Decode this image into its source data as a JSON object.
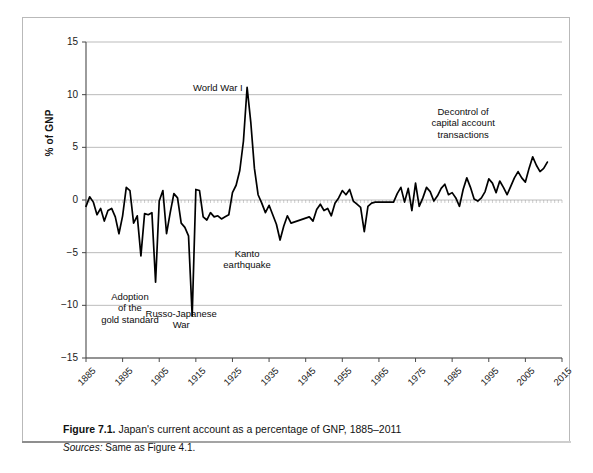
{
  "figure": {
    "caption_label": "Figure 7.1.",
    "caption_text": "Japan's current account as a percentage of GNP, 1885–2011",
    "sources_label": "Sources:",
    "sources_text": "Same as Figure 4.1."
  },
  "chart_data": {
    "type": "line",
    "title": "",
    "xlabel": "",
    "ylabel": "% of GNP",
    "xlim": [
      1885,
      2015
    ],
    "ylim": [
      -15,
      15
    ],
    "yticks": [
      15,
      10,
      5,
      0,
      -5,
      -10,
      -15
    ],
    "xticks": [
      1885,
      1895,
      1905,
      1915,
      1925,
      1935,
      1945,
      1955,
      1965,
      1975,
      1985,
      1995,
      2005,
      2015
    ],
    "grid": true,
    "legend": "none",
    "line_color": "#000000",
    "annotations": [
      {
        "name": "adoption-of-the-gold-standard",
        "lines": [
          "Adoption",
          "of the",
          "gold standard"
        ],
        "x": 1897,
        "y": -9.2
      },
      {
        "name": "russo-japanese-war",
        "lines": [
          "Russo-Japanese",
          "War"
        ],
        "x": 1911,
        "y": -10.8
      },
      {
        "name": "world-war-i",
        "lines": [
          "World War I"
        ],
        "x": 1921,
        "y": 10.6
      },
      {
        "name": "kanto-earthquake",
        "lines": [
          "Kanto",
          "earthquake"
        ],
        "x": 1929,
        "y": -5.1
      },
      {
        "name": "decontrol-of-capital-account-transactions",
        "lines": [
          "Decontrol of",
          "capital account",
          "transactions"
        ],
        "x": 1988,
        "y": 8.4
      }
    ],
    "x": [
      1885,
      1886,
      1887,
      1888,
      1889,
      1890,
      1891,
      1892,
      1893,
      1894,
      1895,
      1896,
      1897,
      1898,
      1899,
      1900,
      1901,
      1902,
      1903,
      1904,
      1905,
      1906,
      1907,
      1908,
      1909,
      1910,
      1911,
      1912,
      1913,
      1914,
      1915,
      1916,
      1917,
      1918,
      1919,
      1920,
      1921,
      1922,
      1923,
      1924,
      1925,
      1926,
      1927,
      1928,
      1929,
      1930,
      1931,
      1932,
      1933,
      1934,
      1935,
      1936,
      1937,
      1938,
      1939,
      1940,
      1941,
      1946,
      1947,
      1948,
      1949,
      1950,
      1951,
      1952,
      1953,
      1954,
      1955,
      1956,
      1957,
      1958,
      1959,
      1960,
      1961,
      1962,
      1963,
      1964,
      1965,
      1966,
      1967,
      1968,
      1969,
      1970,
      1971,
      1972,
      1973,
      1974,
      1975,
      1976,
      1977,
      1978,
      1979,
      1980,
      1981,
      1982,
      1983,
      1984,
      1985,
      1986,
      1987,
      1988,
      1989,
      1990,
      1991,
      1992,
      1993,
      1994,
      1995,
      1996,
      1997,
      1998,
      1999,
      2000,
      2001,
      2002,
      2003,
      2004,
      2005,
      2006,
      2007,
      2008,
      2009,
      2010,
      2011
    ],
    "y": [
      -0.6,
      0.3,
      -0.2,
      -1.4,
      -0.8,
      -2.0,
      -1.0,
      -0.8,
      -1.6,
      -3.2,
      -1.5,
      1.2,
      0.9,
      -2.2,
      -1.5,
      -5.3,
      -1.3,
      -1.4,
      -1.2,
      -7.8,
      -0.1,
      0.9,
      -3.2,
      -1.2,
      0.6,
      0.2,
      -2.2,
      -2.6,
      -3.4,
      -11.0,
      1.0,
      0.9,
      -1.6,
      -1.9,
      -1.2,
      -1.6,
      -1.5,
      -1.8,
      -1.6,
      -1.4,
      0.7,
      1.4,
      2.8,
      5.6,
      10.7,
      7.4,
      3.0,
      0.5,
      -0.3,
      -1.2,
      -0.5,
      -1.4,
      -2.3,
      -3.8,
      -2.5,
      -1.5,
      -2.2,
      -1.6,
      -2.0,
      -0.9,
      -0.4,
      -1.0,
      -0.8,
      -1.5,
      -0.3,
      0.2,
      0.9,
      0.5,
      1.0,
      -0.1,
      -0.4,
      -0.7,
      -3.0,
      -0.6,
      -0.3,
      -0.2,
      -0.2,
      -0.2,
      -0.2,
      -0.2,
      -0.2,
      0.6,
      1.2,
      -0.2,
      1.1,
      -1.0,
      1.6,
      -0.6,
      0.2,
      1.2,
      0.8,
      -0.1,
      0.4,
      1.1,
      1.5,
      0.5,
      0.7,
      0.2,
      -0.6,
      1.0,
      2.1,
      1.2,
      0.1,
      -0.1,
      0.2,
      0.8,
      2.0,
      1.6,
      0.7,
      1.8,
      1.2,
      0.5,
      1.3,
      2.1,
      2.7,
      2.1,
      1.7,
      3.0,
      4.1,
      3.3,
      2.7,
      3.0,
      3.6,
      3.2,
      2.6,
      3.2,
      3.6,
      4.8,
      3.2,
      2.8,
      3.7,
      2.1
    ]
  }
}
